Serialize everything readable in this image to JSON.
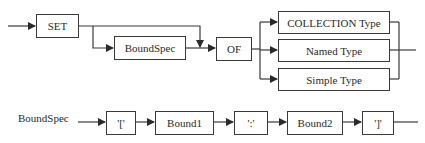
{
  "diagram": {
    "type": "syntax-railroad",
    "top_rule": {
      "nodes": {
        "set": "SET",
        "boundspec": "BoundSpec",
        "of": "OF",
        "collection_type": "COLLECTION Type",
        "named_type": "Named Type",
        "simple_type": "Simple Type"
      }
    },
    "bottom_rule": {
      "label": "BoundSpec",
      "nodes": {
        "open_bracket": "'['",
        "bound1": "Bound1",
        "colon": "':'",
        "bound2": "Bound2",
        "close_bracket": "']'"
      }
    },
    "colors": {
      "line": "#3a3a3a",
      "text": "#2a2a2a",
      "background": "#ffffff"
    }
  }
}
